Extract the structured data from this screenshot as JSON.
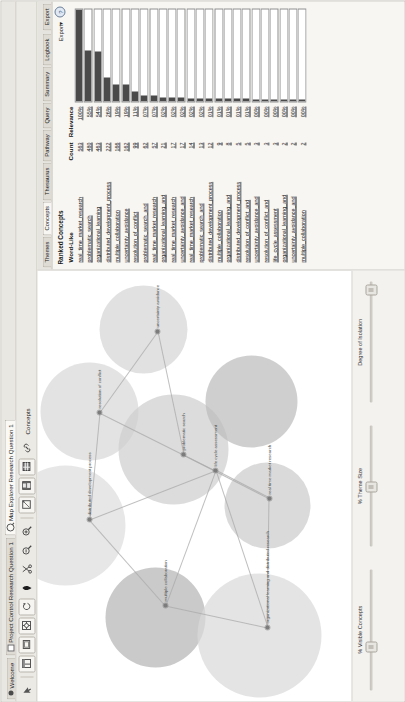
{
  "window": {
    "tabs": [
      {
        "label": "Welcome",
        "icon": "dot-icon",
        "active": false
      },
      {
        "label": "Project Control Research Question 1",
        "icon": "grid-icon",
        "active": false
      },
      {
        "label": "Map Explorer Research Question 1",
        "icon": "magnifier-icon",
        "active": true
      }
    ]
  },
  "toolbar": {
    "buttons": [
      {
        "name": "cursor-icon",
        "glyph": "cursor"
      },
      {
        "name": "window-layout-icon",
        "glyph": "layout"
      },
      {
        "name": "image-icon",
        "glyph": "image"
      },
      {
        "name": "target-icon",
        "glyph": "target"
      },
      {
        "name": "refresh-icon",
        "glyph": "refresh"
      },
      {
        "name": "shape-icon",
        "glyph": "diamond"
      },
      {
        "name": "scissors-icon",
        "glyph": "scissors"
      },
      {
        "name": "zoom-out-icon",
        "glyph": "zoomout"
      },
      {
        "name": "zoom-in-icon",
        "glyph": "zoomin"
      },
      {
        "name": "crop-icon",
        "glyph": "crop"
      },
      {
        "name": "save-icon",
        "glyph": "save"
      },
      {
        "name": "table-icon",
        "glyph": "table"
      },
      {
        "name": "link-icon",
        "glyph": "link"
      }
    ],
    "concepts_label": "Concepts"
  },
  "map": {
    "themes": [
      {
        "label": "distributed development process",
        "x": 176,
        "y": 28,
        "r": 60,
        "shade": "#dedede"
      },
      {
        "label": "resolution of conflict",
        "x": 290,
        "y": 52,
        "r": 49,
        "shade": "#d8d8d8"
      },
      {
        "label": "uncertainty avoidance",
        "x": 372,
        "y": 106,
        "r": 44,
        "shade": "#d5d5d5"
      },
      {
        "label": "multiple collaboration",
        "x": 84,
        "y": 118,
        "r": 50,
        "shade": "#b5b5b5"
      },
      {
        "label": "problematic search and distributed development process",
        "x": 252,
        "y": 136,
        "r": 55,
        "shade": "#cfcfcf"
      },
      {
        "label": "organizational learning and distributed research",
        "x": 66,
        "y": 222,
        "r": 62,
        "shade": "#d9d9d9"
      },
      {
        "label": "real time market research",
        "x": 196,
        "y": 230,
        "r": 43,
        "shade": "#cccccc"
      },
      {
        "label": "uncertainty avoidance and real time market research",
        "x": 300,
        "y": 214,
        "r": 46,
        "shade": "#bdbdbd"
      }
    ],
    "nodes": [
      {
        "label": "distributed development process",
        "x": 182,
        "y": 52
      },
      {
        "label": "resolution of conflict",
        "x": 289,
        "y": 62
      },
      {
        "label": "uncertainty avoidance",
        "x": 370,
        "y": 120
      },
      {
        "label": "multiple collaboration",
        "x": 96,
        "y": 128
      },
      {
        "label": "problematic search",
        "x": 247,
        "y": 146
      },
      {
        "label": "real time market research",
        "x": 203,
        "y": 232
      },
      {
        "label": "organizational learning and distributed research",
        "x": 74,
        "y": 230
      },
      {
        "label": "life cycle assessment",
        "x": 231,
        "y": 178
      }
    ]
  },
  "sliders": [
    {
      "label": "% Visible Concepts",
      "value": 35
    },
    {
      "label": "% Theme Size",
      "value": 48
    },
    {
      "label": "Degree of Isolation",
      "value": 92
    }
  ],
  "panel": {
    "tabs": [
      {
        "label": "Themes",
        "active": false
      },
      {
        "label": "Concepts",
        "active": true
      },
      {
        "label": "Thesaurus",
        "active": false
      },
      {
        "label": "Pathway",
        "active": false
      },
      {
        "label": "Query",
        "active": false
      },
      {
        "label": "Summary",
        "active": false
      },
      {
        "label": "Logbook",
        "active": false
      },
      {
        "label": "Export",
        "active": false
      }
    ],
    "title": "Ranked Concepts",
    "export_label": "Export▾",
    "help_icon": "?",
    "columns": {
      "word": "Word-Like",
      "count": "Count",
      "relevance": "Relevance"
    },
    "rows": [
      {
        "word": "real_time_market_research",
        "count": "563",
        "relevance": "100%",
        "bar": 100
      },
      {
        "word": "problematic_search",
        "count": "480",
        "relevance": "55%",
        "bar": 55
      },
      {
        "word": "organizational_learning",
        "count": "463",
        "relevance": "54%",
        "bar": 54
      },
      {
        "word": "distributed_development_process",
        "count": "222",
        "relevance": "26%",
        "bar": 26
      },
      {
        "word": "multiple_collaboration",
        "count": "166",
        "relevance": "19%",
        "bar": 19
      },
      {
        "word": "uncertainty_avoidance",
        "count": "162",
        "relevance": "19%",
        "bar": 19
      },
      {
        "word": "resolution_of_conflict",
        "count": "99",
        "relevance": "11%",
        "bar": 11
      },
      {
        "word": "problematic_search_and",
        "count": "62",
        "relevance": "07%",
        "bar": 7
      },
      {
        "word": "real_time_market_research",
        "count": "57",
        "relevance": "07%",
        "bar": 7
      },
      {
        "word": "organizational_learning_and",
        "count": "21",
        "relevance": "02%",
        "bar": 4
      },
      {
        "word": "real_time_market_research",
        "count": "17",
        "relevance": "02%",
        "bar": 4
      },
      {
        "word": "uncertainty_avoidance_and",
        "count": "17",
        "relevance": "02%",
        "bar": 4
      },
      {
        "word": "real_time_market_research",
        "count": "14",
        "relevance": "02%",
        "bar": 3
      },
      {
        "word": "problematic_search_and",
        "count": "13",
        "relevance": "02%",
        "bar": 3
      },
      {
        "word": "distributed_development_process",
        "count": "12",
        "relevance": "01%",
        "bar": 3
      },
      {
        "word": "multiple_collaboration",
        "count": "9",
        "relevance": "01%",
        "bar": 3
      },
      {
        "word": "organizational_learning_and",
        "count": "8",
        "relevance": "01%",
        "bar": 3
      },
      {
        "word": "distributed_development_process",
        "count": "5",
        "relevance": "01%",
        "bar": 3
      },
      {
        "word": "resolution_of_conflict_and",
        "count": "5",
        "relevance": "01%",
        "bar": 3
      },
      {
        "word": "uncertainty_avoidance_and",
        "count": "3",
        "relevance": "00%",
        "bar": 2
      },
      {
        "word": "resolution_of_conflict_and",
        "count": "3",
        "relevance": "00%",
        "bar": 2
      },
      {
        "word": "life_cycle_assessment",
        "count": "3",
        "relevance": "00%",
        "bar": 2
      },
      {
        "word": "organizational_learning_and",
        "count": "2",
        "relevance": "00%",
        "bar": 2
      },
      {
        "word": "uncertainty_avoidance_and",
        "count": "2",
        "relevance": "00%",
        "bar": 2
      },
      {
        "word": "multiple_collaboration",
        "count": "2",
        "relevance": "00%",
        "bar": 2
      }
    ]
  }
}
